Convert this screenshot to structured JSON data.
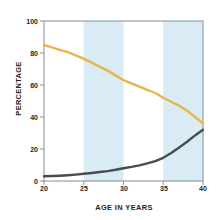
{
  "chart_data": {
    "type": "line",
    "title": "",
    "subtitle": "",
    "xlabel": "AGE IN YEARS",
    "ylabel": "PERCENTAGE",
    "xlim": [
      20,
      40
    ],
    "ylim": [
      0,
      100
    ],
    "xticks": [
      20,
      25,
      30,
      35,
      40
    ],
    "yticks": [
      0,
      20,
      40,
      60,
      80,
      100
    ],
    "xtick_labels": [
      "20",
      "25",
      "30",
      "35",
      "40"
    ],
    "ytick_labels": [
      "0",
      "20",
      "40",
      "60",
      "80",
      "100"
    ],
    "grid": false,
    "legend": "none",
    "background_bands": {
      "color": "#d9ecf5",
      "alt_color": "#ffffff",
      "ranges": [
        [
          25,
          30
        ],
        [
          35,
          40
        ]
      ]
    },
    "x": [
      20,
      21,
      22,
      23,
      24,
      25,
      26,
      27,
      28,
      29,
      30,
      31,
      32,
      33,
      34,
      35,
      36,
      37,
      38,
      39,
      40
    ],
    "series": [
      {
        "name": "declining-series",
        "color": "#e8b54d",
        "values": [
          85,
          83.5,
          82,
          80.5,
          78.5,
          76.5,
          74,
          71.5,
          69,
          66,
          63,
          61,
          59,
          57,
          55,
          52,
          49.5,
          47,
          44,
          40,
          36
        ]
      },
      {
        "name": "rising-series",
        "color": "#4a4a52",
        "values": [
          3,
          3.1,
          3.3,
          3.6,
          4,
          4.5,
          5,
          5.6,
          6.2,
          7,
          8,
          8.8,
          9.8,
          11,
          12.4,
          14.5,
          17.5,
          21,
          24.5,
          28.5,
          32
        ]
      }
    ],
    "axis_color": "#8a9aa5",
    "text_color": "#231f20"
  }
}
